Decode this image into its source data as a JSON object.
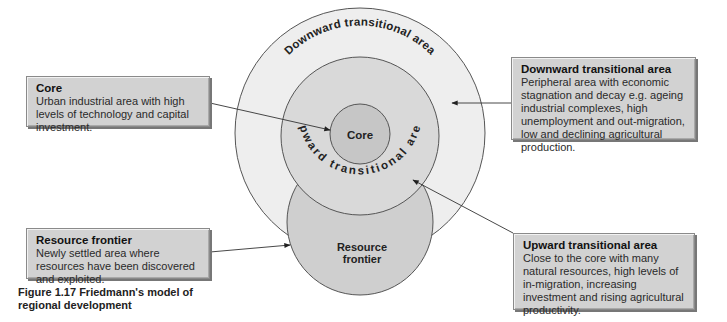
{
  "figure": {
    "caption": "Figure 1.17 Friedmann's model of regional development"
  },
  "diagram": {
    "circles": {
      "outer_label": "Downward transitional area",
      "middle_label": "Upward transitional area",
      "core_label": "Core",
      "resource_label_line1": "Resource",
      "resource_label_line2": "frontier"
    },
    "colors": {
      "outer_fill": "#eeeeee",
      "middle_fill": "#d9d9d9",
      "core_fill": "#c6c6c6",
      "resource_fill": "#cfcfcf",
      "stroke": "#555555",
      "box_fill": "#d2d2d2"
    }
  },
  "boxes": {
    "core": {
      "title": "Core",
      "desc": "Urban industrial area with high levels of technology and capital investment."
    },
    "resource_frontier": {
      "title": "Resource frontier",
      "desc": "Newly settled area where resources have been discovered and exploited."
    },
    "downward": {
      "title": "Downward transitional area",
      "desc": "Peripheral area with economic stagnation and decay e.g. ageing industrial complexes, high unemployment and out-migration, low and declining agricultural production."
    },
    "upward": {
      "title": "Upward transitional area",
      "desc": "Close to the core with many natural resources, high levels of in-migration, increasing investment and rising agricultural productivity."
    }
  }
}
